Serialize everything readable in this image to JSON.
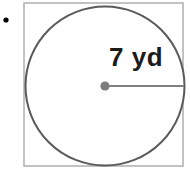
{
  "figure": {
    "kind": "geometry-diagram",
    "canvas": {
      "width": 190,
      "height": 173,
      "background": "#ffffff"
    },
    "bullet": {
      "name": "list-bullet",
      "color": "#000000",
      "cx": 6,
      "cy": 20,
      "r": 2.6
    },
    "square": {
      "name": "bounding-square",
      "x": 24,
      "y": 3,
      "width": 159,
      "height": 163,
      "stroke": "#b3b3b3",
      "stroke_width": 1.6,
      "fill": "none"
    },
    "circle": {
      "name": "inscribed-circle",
      "cx": 105,
      "cy": 86,
      "r": 79.5,
      "stroke": "#5a5a5a",
      "stroke_width": 2,
      "fill": "#ffffff"
    },
    "center_point": {
      "name": "circle-center-point",
      "cx": 105,
      "cy": 86,
      "r": 4.6,
      "fill": "#7c7c7c"
    },
    "radius_segment": {
      "name": "radius-segment",
      "x1": 105,
      "y1": 86,
      "x2": 184,
      "y2": 86,
      "stroke": "#808080",
      "stroke_width": 2.2
    },
    "radius_label": {
      "name": "radius-measure-label",
      "text": "7 yd",
      "value": 7,
      "unit": "yd",
      "color": "#1b1b1b",
      "left": 109,
      "top": 44,
      "font_size": 26
    }
  },
  "chart_data": {
    "type": "diagram",
    "title": "",
    "shapes": [
      {
        "shape": "square",
        "role": "circumscribed bounding square",
        "side_px": 159,
        "stroke": "#b3b3b3"
      },
      {
        "shape": "circle",
        "role": "inscribed circle",
        "radius_px": 79.5,
        "radius_value": 7,
        "radius_unit": "yd",
        "diameter_value": 14,
        "stroke": "#5a5a5a"
      },
      {
        "shape": "segment",
        "role": "radius",
        "label": "7 yd",
        "from": "center",
        "to": "right edge of circle"
      }
    ],
    "annotations": [
      "7 yd"
    ],
    "legend": [],
    "grid": false
  }
}
